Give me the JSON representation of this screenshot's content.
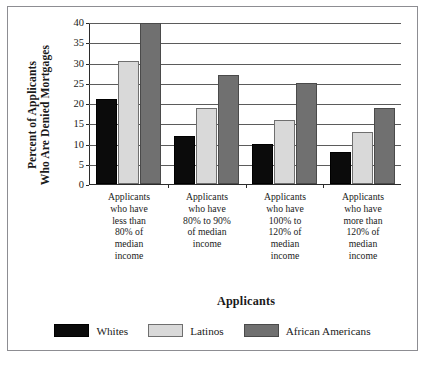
{
  "chart_data": {
    "type": "bar",
    "title": "",
    "xlabel": "Applicants",
    "ylabel_lines": [
      "Percent of Applicants",
      "Who Are Denied Mortgages"
    ],
    "categories": [
      "Applicants who have less than 80% of median income",
      "Applicants who have 80% to 90% of median income",
      "Applicants who have 100% to 120% of median income",
      "Applicants who have more than 120% of median income"
    ],
    "category_lines": [
      [
        "Applicants",
        "who have",
        "less than",
        "80% of",
        "median",
        "income"
      ],
      [
        "Applicants",
        "who have",
        "80% to 90%",
        "of median",
        "income"
      ],
      [
        "Applicants",
        "who have",
        "100% to",
        "120% of",
        "median",
        "income"
      ],
      [
        "Applicants",
        "who have",
        "more than",
        "120% of",
        "median",
        "income"
      ]
    ],
    "series": [
      {
        "name": "Whites",
        "color": "#0b0b0b",
        "values": [
          21,
          12,
          10,
          8
        ]
      },
      {
        "name": "Latinos",
        "color": "#d9d9d9",
        "values": [
          30.5,
          19,
          16,
          13
        ]
      },
      {
        "name": "African Americans",
        "color": "#707070",
        "values": [
          40,
          27,
          25,
          19
        ]
      }
    ],
    "ylim": [
      0,
      40
    ],
    "yticks": [
      0,
      5,
      10,
      15,
      20,
      25,
      30,
      35,
      40
    ],
    "ytick_labels": [
      "0",
      "5",
      "10",
      "15",
      "20",
      "25",
      "30",
      "35",
      "40"
    ],
    "grid": true,
    "legend_position": "bottom"
  },
  "legend": {
    "items": [
      {
        "label": "Whites",
        "swatch": "whites"
      },
      {
        "label": "Latinos",
        "swatch": "latinos"
      },
      {
        "label": "African Americans",
        "swatch": "african"
      }
    ]
  }
}
